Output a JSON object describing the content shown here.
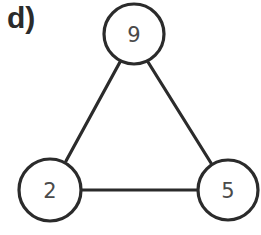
{
  "panel_label": "d)",
  "colors": {
    "stroke": "#2b2b2b",
    "node_fill": "#ffffff",
    "text": "#4a4a4a"
  },
  "graph": {
    "nodes": [
      {
        "id": "top",
        "label": "9",
        "cx": 134,
        "cy": 34,
        "r": 30
      },
      {
        "id": "left",
        "label": "2",
        "cx": 50,
        "cy": 190,
        "r": 31
      },
      {
        "id": "right",
        "label": "5",
        "cx": 228,
        "cy": 190,
        "r": 30
      }
    ],
    "edges": [
      {
        "from": "top",
        "to": "left"
      },
      {
        "from": "top",
        "to": "right"
      },
      {
        "from": "left",
        "to": "right"
      }
    ]
  }
}
